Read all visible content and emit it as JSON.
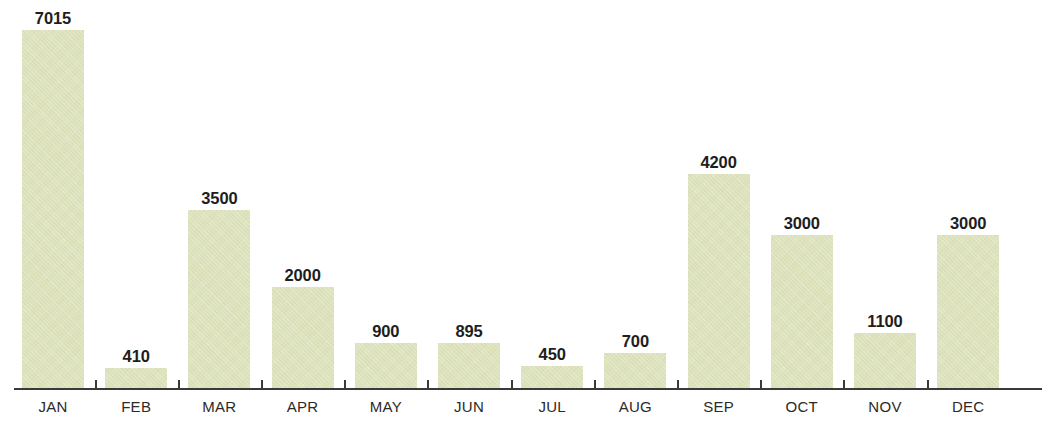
{
  "chart_data": {
    "type": "bar",
    "title": "",
    "subtitle": "",
    "xlabel": "",
    "ylabel": "",
    "categories": [
      "JAN",
      "FEB",
      "MAR",
      "APR",
      "MAY",
      "JUN",
      "JUL",
      "AUG",
      "SEP",
      "OCT",
      "NOV",
      "DEC"
    ],
    "values": [
      7015,
      410,
      3500,
      2000,
      900,
      895,
      450,
      700,
      4200,
      3000,
      1100,
      3000
    ],
    "value_labels": [
      "7015",
      "410",
      "3500",
      "2000",
      "900",
      "895",
      "450",
      "700",
      "4200",
      "3000",
      "1100",
      "3000"
    ],
    "ylim": [
      0,
      7015
    ],
    "grid": false,
    "legend": null,
    "annotations": [],
    "bar_color": "#dee3ba",
    "label_color": "#211d1c",
    "axis_color": "#3c3a38",
    "background_color": "#ffffff",
    "tick_labels_shown": true,
    "y_axis_shown": false,
    "data_labels_shown": true
  },
  "bars": [
    {
      "category": "JAN",
      "value": 7015,
      "label": "7015"
    },
    {
      "category": "FEB",
      "value": 410,
      "label": "410"
    },
    {
      "category": "MAR",
      "value": 3500,
      "label": "3500"
    },
    {
      "category": "APR",
      "value": 2000,
      "label": "2000"
    },
    {
      "category": "MAY",
      "value": 900,
      "label": "900"
    },
    {
      "category": "JUN",
      "value": 895,
      "label": "895"
    },
    {
      "category": "JUL",
      "value": 450,
      "label": "450"
    },
    {
      "category": "AUG",
      "value": 700,
      "label": "700"
    },
    {
      "category": "SEP",
      "value": 4200,
      "label": "4200"
    },
    {
      "category": "OCT",
      "value": 3000,
      "label": "3000"
    },
    {
      "category": "NOV",
      "value": 1100,
      "label": "1100"
    },
    {
      "category": "DEC",
      "value": 3000,
      "label": "3000"
    }
  ]
}
